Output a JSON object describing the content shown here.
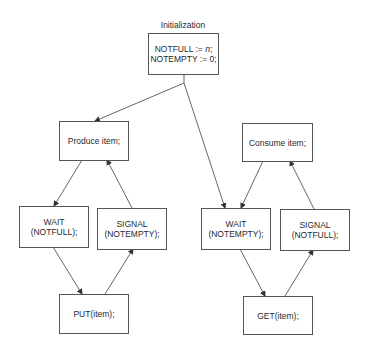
{
  "title": "Initialization",
  "init": {
    "line1_prefix": "NOTFULL := ",
    "line1_var": "n",
    "line1_suffix": ";",
    "line2": "NOTEMPTY := 0;"
  },
  "producer": {
    "produce": "Produce item;",
    "wait": {
      "line1": "WAIT",
      "line2": "(NOTFULL);"
    },
    "signal": {
      "line1": "SIGNAL",
      "line2": "(NOTEMPTY);"
    },
    "put": "PUT(item);"
  },
  "consumer": {
    "consume": "Consume item;",
    "wait": {
      "line1": "WAIT",
      "line2": "(NOTEMPTY);"
    },
    "signal": {
      "line1": "SIGNAL",
      "line2": "(NOTFULL);"
    },
    "get": "GET(item);"
  },
  "colors": {
    "line": "#555555",
    "text": "#2a2a2a",
    "background": "#ffffff"
  }
}
